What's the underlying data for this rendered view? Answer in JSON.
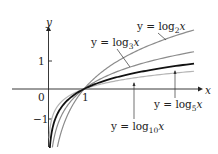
{
  "chart_data": {
    "type": "line",
    "title": "",
    "xlabel": "x",
    "ylabel": "y",
    "xlim": [
      -1.1,
      4.3
    ],
    "ylim": [
      -3.0,
      2.5
    ],
    "grid": false,
    "legend": "inline annotations",
    "tick_labels": {
      "x": [
        "0",
        "1"
      ],
      "y": [
        "1",
        "-1"
      ]
    },
    "series": [
      {
        "name": "y = log2 x",
        "base": 2,
        "color": "#8c8c8c",
        "width": 1.2
      },
      {
        "name": "y = log3 x",
        "base": 3,
        "color": "#8c8c8c",
        "width": 1.2
      },
      {
        "name": "y = log5 x",
        "base": 5,
        "color": "#111111",
        "width": 1.8
      },
      {
        "name": "y = log10 x",
        "base": 10,
        "color": "#b4b4b4",
        "width": 1.2
      }
    ],
    "annotations": [
      {
        "text": "y = log2 x",
        "points_to": "log2"
      },
      {
        "text": "y = log3 x",
        "points_to": "log3"
      },
      {
        "text": "y = log5 x",
        "points_to": "log5"
      },
      {
        "text": "y = log10 x",
        "points_to": "log10"
      }
    ]
  },
  "labels": {
    "x_axis": "x",
    "y_axis": "y",
    "origin": "0",
    "x_one": "1",
    "y_one": "1",
    "y_minus_one": "−1",
    "log2": {
      "prefix": "y = log",
      "sub": "2",
      "suffix": "x"
    },
    "log3": {
      "prefix": "y = log",
      "sub": "3",
      "suffix": "x"
    },
    "log5": {
      "prefix": "y = log",
      "sub": "5",
      "suffix": "x"
    },
    "log10": {
      "prefix": "y = log",
      "sub": "10",
      "suffix": "x"
    }
  }
}
